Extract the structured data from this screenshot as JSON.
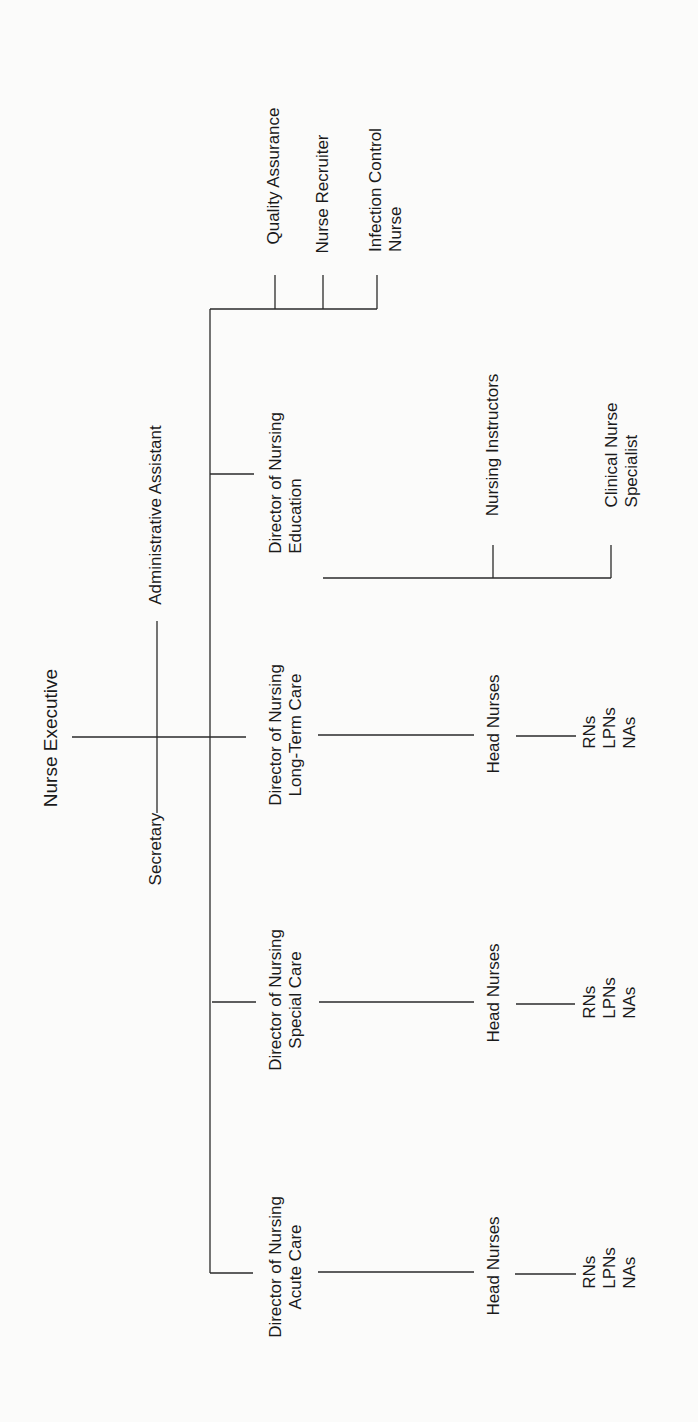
{
  "chart": {
    "type": "org-chart",
    "orientation": "rotated-90-ccw",
    "root": "Nurse Executive",
    "staff": [
      "Administrative Assistant",
      "Secretary"
    ]
  },
  "nodes": {
    "nurse_executive": {
      "line1": "Nurse Executive"
    },
    "administrative_assistant": {
      "line1": "Administrative Assistant"
    },
    "secretary": {
      "line1": "Secretary"
    },
    "quality_assurance": {
      "line1": "Quality Assurance"
    },
    "nurse_recruiter": {
      "line1": "Nurse Recruiter"
    },
    "infection_control": {
      "line1": "Infection Control",
      "line2": "Nurse"
    },
    "dir_education": {
      "line1": "Director of Nursing",
      "line2": "Education"
    },
    "nursing_instructors": {
      "line1": "Nursing Instructors"
    },
    "clinical_nurse_specialist": {
      "line1": "Clinical Nurse",
      "line2": "Specialist"
    },
    "dir_long_term": {
      "line1": "Director of Nursing",
      "line2": "Long-Term Care"
    },
    "head_nurses_long_term": {
      "line1": "Head Nurses"
    },
    "staff_long_term": {
      "line1": "RNs",
      "line2": "LPNs",
      "line3": "NAs"
    },
    "dir_special": {
      "line1": "Director of Nursing",
      "line2": "Special Care"
    },
    "head_nurses_special": {
      "line1": "Head Nurses"
    },
    "staff_special": {
      "line1": "RNs",
      "line2": "LPNs",
      "line3": "NAs"
    },
    "dir_acute": {
      "line1": "Director of Nursing",
      "line2": "Acute Care"
    },
    "head_nurses_acute": {
      "line1": "Head Nurses"
    },
    "staff_acute": {
      "line1": "RNs",
      "line2": "LPNs",
      "line3": "NAs"
    }
  },
  "hierarchy": [
    {
      "name": "Nurse Executive",
      "children": [
        {
          "name": "Quality Assurance"
        },
        {
          "name": "Nurse Recruiter"
        },
        {
          "name": "Infection Control Nurse"
        },
        {
          "name": "Director of Nursing Education",
          "children": [
            {
              "name": "Nursing Instructors"
            },
            {
              "name": "Clinical Nurse Specialist"
            }
          ]
        },
        {
          "name": "Director of Nursing Long-Term Care",
          "children": [
            {
              "name": "Head Nurses",
              "children": [
                {
                  "name": "RNs, LPNs, NAs"
                }
              ]
            }
          ]
        },
        {
          "name": "Director of Nursing Special Care",
          "children": [
            {
              "name": "Head Nurses",
              "children": [
                {
                  "name": "RNs, LPNs, NAs"
                }
              ]
            }
          ]
        },
        {
          "name": "Director of Nursing Acute Care",
          "children": [
            {
              "name": "Head Nurses",
              "children": [
                {
                  "name": "RNs, LPNs, NAs"
                }
              ]
            }
          ]
        }
      ]
    }
  ]
}
